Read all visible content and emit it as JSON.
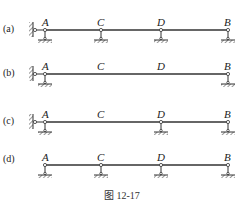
{
  "figure": {
    "caption": "图 12-17",
    "rows": [
      {
        "case_label": "(a)",
        "left_end": "fixed-wall-link",
        "nodes": [
          {
            "label": "A",
            "support": "pin"
          },
          {
            "label": "C",
            "support": "pin"
          },
          {
            "label": "D",
            "support": "pin"
          },
          {
            "label": "B",
            "support": "pin"
          }
        ]
      },
      {
        "case_label": "(b)",
        "left_end": "fixed-wall-link",
        "nodes": [
          {
            "label": "A",
            "support": "pin"
          },
          {
            "label": "C",
            "support": "none"
          },
          {
            "label": "D",
            "support": "none"
          },
          {
            "label": "B",
            "support": "pin"
          }
        ]
      },
      {
        "case_label": "(c)",
        "left_end": "fixed-wall-link",
        "nodes": [
          {
            "label": "A",
            "support": "pin"
          },
          {
            "label": "C",
            "support": "none"
          },
          {
            "label": "D",
            "support": "pin"
          },
          {
            "label": "B",
            "support": "pin"
          }
        ]
      },
      {
        "case_label": "(d)",
        "left_end": "none",
        "nodes": [
          {
            "label": "A",
            "support": "pin"
          },
          {
            "label": "C",
            "support": "pin"
          },
          {
            "label": "D",
            "support": "pin"
          },
          {
            "label": "B",
            "support": "pin"
          }
        ]
      }
    ]
  },
  "colors": {
    "line": "#333333",
    "background": "#ffffff"
  }
}
